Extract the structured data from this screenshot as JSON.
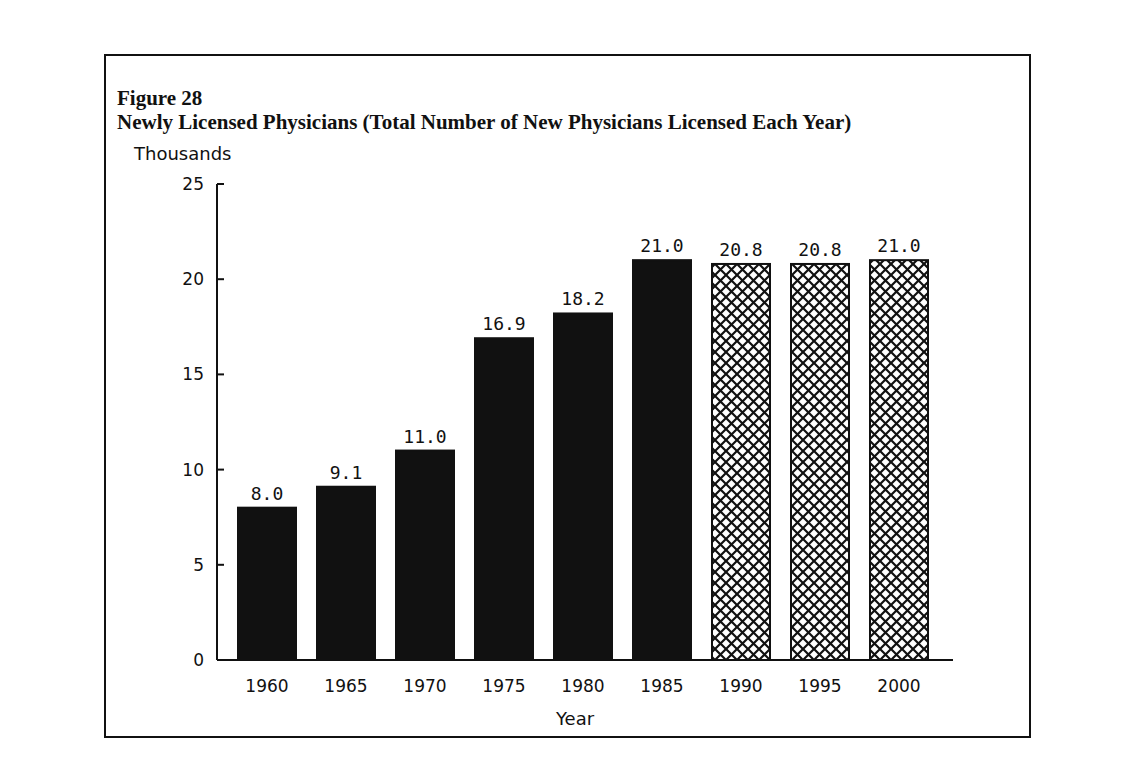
{
  "figure": {
    "label": "Figure 28",
    "title": "Newly Licensed Physicians (Total Number of New Physicians Licensed Each Year)",
    "unit_label": "Thousands"
  },
  "chart_data": {
    "type": "bar",
    "title": "Newly Licensed Physicians (Total Number of New Physicians Licensed Each Year)",
    "xlabel": "Year",
    "ylabel": "Thousands",
    "ylim": [
      0,
      25
    ],
    "yticks": [
      0,
      5,
      10,
      15,
      20,
      25
    ],
    "grid": false,
    "categories": [
      "1960",
      "1965",
      "1970",
      "1975",
      "1980",
      "1985",
      "1990",
      "1995",
      "2000"
    ],
    "values": [
      8.0,
      9.1,
      11.0,
      16.9,
      18.2,
      21.0,
      20.8,
      20.8,
      21.0
    ],
    "value_labels": [
      "8.0",
      "9.1",
      "11.0",
      "16.9",
      "18.2",
      "21.0",
      "20.8",
      "20.8",
      "21.0"
    ],
    "styles": [
      "solid",
      "solid",
      "solid",
      "solid",
      "solid",
      "solid",
      "crosshatch",
      "crosshatch",
      "crosshatch"
    ],
    "annotations": "Solid bars = actual; crosshatched bars = projected"
  }
}
